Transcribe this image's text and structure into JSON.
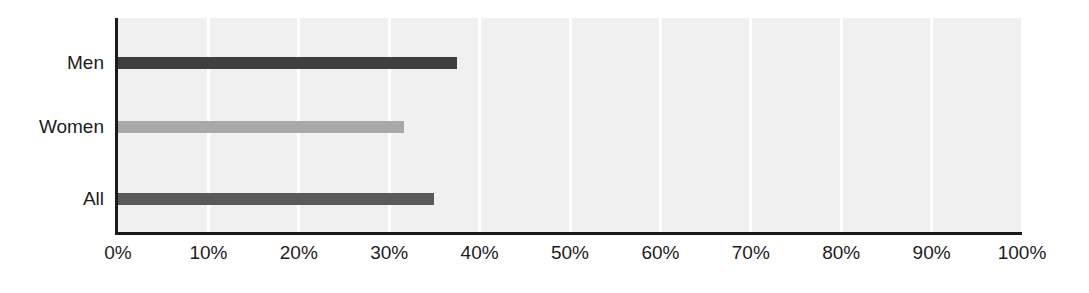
{
  "chart_data": {
    "type": "bar",
    "orientation": "horizontal",
    "title": "",
    "subtitle": "",
    "xlabel": "",
    "ylabel": "",
    "categories": [
      "Men",
      "Women",
      "All"
    ],
    "values": [
      37.5,
      31.6,
      35.0
    ],
    "value_labels": [
      "37.5%",
      "31.6%",
      "35.0%"
    ],
    "series": [
      {
        "name": "Share",
        "values": [
          37.5,
          31.6,
          35.0
        ]
      }
    ],
    "bars": [
      {
        "category": "Men",
        "value": 37.5,
        "color": "#3f3f3f"
      },
      {
        "category": "Women",
        "value": 31.6,
        "color": "#a8a8a8"
      },
      {
        "category": "All",
        "value": 35.0,
        "color": "#595959"
      }
    ],
    "xlim": [
      0,
      100
    ],
    "xticks": [
      0,
      10,
      20,
      30,
      40,
      50,
      60,
      70,
      80,
      90,
      100
    ],
    "xtick_labels": [
      "0%",
      "10%",
      "20%",
      "30%",
      "40%",
      "50%",
      "60%",
      "70%",
      "80%",
      "90%",
      "100%"
    ],
    "grid": true,
    "grid_axis": "x",
    "grid_color": "#ffffff",
    "plot_background": "#f0f0f0",
    "legend": false,
    "legend_position": "none",
    "annotations": []
  },
  "axis": {
    "line_color": "#1a1a1a",
    "label_color": "#1c1c1c"
  }
}
